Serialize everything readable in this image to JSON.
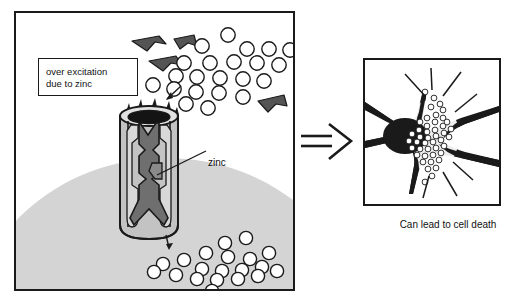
{
  "figure": {
    "width": 520,
    "height": 303,
    "background_color": "#ffffff",
    "type": "scientific-illustration"
  },
  "colors": {
    "outline": "#1a1a1a",
    "membrane_gray": "#d2d2d2",
    "channel_subunit_gray": "#b4b4b4",
    "channel_subunit_light": "#c8c8c8",
    "channel_pore_dark": "#6e6e6e",
    "channel_pore_darker": "#595959",
    "arrowhead_gray": "#555555",
    "ion_fill": "#ffffff",
    "neuron_fill": "#1a1a1a",
    "panel_background": "#ffffff",
    "text_color": "#111111"
  },
  "left_panel": {
    "name": "ion-channel-scene",
    "caption_box": {
      "line_1": "over excitation",
      "line_2": "due to zinc"
    },
    "labels": {
      "zinc": "zinc"
    },
    "membrane": {
      "description": "cell membrane surface dome",
      "fill": "#d2d2d2"
    },
    "channel": {
      "description": "cylindrical ion channel with subunits and central pore",
      "subunit_count": 4,
      "pore_label": "zinc"
    },
    "ion_clusters": [
      {
        "name": "upper-ion-cluster",
        "count": 22,
        "positions": [
          [
            212,
            22
          ],
          [
            186,
            33
          ],
          [
            231,
            36
          ],
          [
            253,
            36
          ],
          [
            274,
            37
          ],
          [
            168,
            50
          ],
          [
            194,
            50
          ],
          [
            218,
            49
          ],
          [
            241,
            50
          ],
          [
            263,
            52
          ],
          [
            160,
            63
          ],
          [
            181,
            64
          ],
          [
            204,
            65
          ],
          [
            227,
            66
          ],
          [
            248,
            68
          ],
          [
            137,
            72
          ],
          [
            158,
            76
          ],
          [
            180,
            79
          ],
          [
            203,
            80
          ],
          [
            227,
            84
          ],
          [
            170,
            91
          ],
          [
            192,
            95
          ]
        ],
        "radius": 7.2
      },
      {
        "name": "lower-ion-cluster",
        "count": 20,
        "positions": [
          [
            209,
            230
          ],
          [
            230,
            225
          ],
          [
            190,
            240
          ],
          [
            212,
            244
          ],
          [
            168,
            247
          ],
          [
            234,
            246
          ],
          [
            253,
            240
          ],
          [
            147,
            251
          ],
          [
            186,
            256
          ],
          [
            206,
            258
          ],
          [
            226,
            257
          ],
          [
            246,
            254
          ],
          [
            138,
            259
          ],
          [
            160,
            262
          ],
          [
            181,
            266
          ],
          [
            201,
            267
          ],
          [
            222,
            266
          ],
          [
            242,
            263
          ],
          [
            261,
            258
          ],
          [
            196,
            278
          ]
        ],
        "radius": 6.6
      }
    ],
    "arrowheads": {
      "name": "excitation-arrowheads",
      "count": 5,
      "description": "dark gray angular chevron shapes representing excitatory input"
    },
    "flow_arrows": [
      {
        "name": "ion-entry-arrow",
        "direction": "down-left"
      },
      {
        "name": "ion-exit-arrow",
        "direction": "down"
      }
    ]
  },
  "transition": {
    "name": "double-line-arrow",
    "glyph": "double-arrow-right",
    "description": "double line arrow pointing right"
  },
  "right_panel": {
    "name": "dying-neuron-scene",
    "caption": "Can lead to cell death",
    "neuron": {
      "description": "neuron silhouette with dendrites and axon",
      "fill": "#1a1a1a",
      "dendrite_count": 4,
      "axon_count": 1
    },
    "soma_ions": {
      "name": "soma-ion-cluster",
      "count": 44,
      "radius": 2.9,
      "positions": [
        [
          60,
          32
        ],
        [
          69,
          38
        ],
        [
          66,
          47
        ],
        [
          75,
          44
        ],
        [
          71,
          55
        ],
        [
          62,
          58
        ],
        [
          55,
          62
        ],
        [
          62,
          66
        ],
        [
          70,
          62
        ],
        [
          78,
          58
        ],
        [
          54,
          70
        ],
        [
          62,
          72
        ],
        [
          70,
          70
        ],
        [
          78,
          66
        ],
        [
          47,
          74
        ],
        [
          55,
          77
        ],
        [
          63,
          78
        ],
        [
          71,
          76
        ],
        [
          79,
          73
        ],
        [
          86,
          69
        ],
        [
          44,
          81
        ],
        [
          52,
          82
        ],
        [
          60,
          83
        ],
        [
          68,
          82
        ],
        [
          76,
          80
        ],
        [
          84,
          77
        ],
        [
          47,
          88
        ],
        [
          55,
          89
        ],
        [
          63,
          89
        ],
        [
          71,
          88
        ],
        [
          79,
          86
        ],
        [
          52,
          95
        ],
        [
          60,
          96
        ],
        [
          68,
          95
        ],
        [
          76,
          93
        ],
        [
          58,
          102
        ],
        [
          66,
          102
        ],
        [
          74,
          100
        ],
        [
          63,
          109
        ],
        [
          71,
          108
        ],
        [
          67,
          116
        ],
        [
          60,
          122
        ],
        [
          78,
          50
        ],
        [
          82,
          62
        ]
      ]
    },
    "burst_lines": {
      "name": "stress-burst-lines",
      "count": 7,
      "description": "radiating straight lines indicating cellular stress"
    }
  }
}
